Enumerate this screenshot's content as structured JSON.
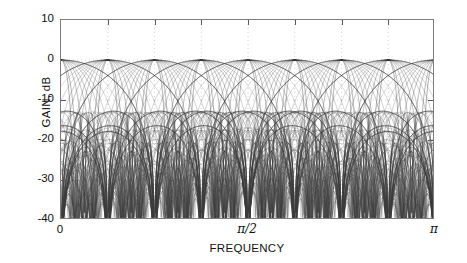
{
  "figure": {
    "kind": "magnitude-response-plot",
    "background_color": "#ffffff",
    "axis_color": "#7d7d7d",
    "curve_color": "#3c3c3c",
    "grid_color": "#c9c9c9"
  },
  "chart_data": {
    "type": "line",
    "title": "",
    "subtitle": "",
    "xlabel": "FREQUENCY",
    "ylabel": "GAIN, dB",
    "xlim": [
      0,
      3.141592653589793
    ],
    "ylim": [
      -40,
      10
    ],
    "grid": true,
    "grid_style": "dotted",
    "legend": null,
    "legend_position": "none",
    "x_tick_labels": [
      "0",
      "π/2",
      "π"
    ],
    "x_tick_values": [
      0,
      1.5707963267948966,
      3.141592653589793
    ],
    "x_minor_tick_values": [
      0.39269908169872414,
      0.7853981633974483,
      1.1780972450961724,
      1.9634954084936207,
      2.356194490192345,
      2.748893571891069
    ],
    "y_tick_labels": [
      "10",
      "0",
      "-10",
      "-20",
      "-30",
      "-40"
    ],
    "y_tick_values": [
      10,
      0,
      -10,
      -20,
      -30,
      -40
    ],
    "num_channels": 8,
    "filter_length": 8,
    "channel_center_frequencies": [
      0,
      0.39269908169872414,
      0.7853981633974483,
      1.1780972450961724,
      1.5707963267948966,
      1.9634954084936207,
      2.356194490192345,
      2.748893571891069,
      3.141592653589793
    ],
    "crossover_gain_db": -3.9,
    "peak_gain_db": 0,
    "first_sidelobe_db": -13.2,
    "floor_db": -40,
    "series_description": "Uniform 8-band DFT filter bank; each band is a Dirichlet kernel |sin(8(w-wk)/2)/(8 sin((w-wk)/2))| in dB, plus nested lower-order sinc sidelobe families.",
    "series": [
      {
        "name": "band 0",
        "center": 0
      },
      {
        "name": "band 1",
        "center": 0.39269908169872414
      },
      {
        "name": "band 2",
        "center": 0.7853981633974483
      },
      {
        "name": "band 3",
        "center": 1.1780972450961724
      },
      {
        "name": "band 4",
        "center": 1.5707963267948966
      },
      {
        "name": "band 5",
        "center": 1.9634954084936207
      },
      {
        "name": "band 6",
        "center": 2.356194490192345
      },
      {
        "name": "band 7",
        "center": 2.748893571891069
      },
      {
        "name": "band 8",
        "center": 3.141592653589793
      }
    ],
    "sidelobe_families": [
      8,
      10,
      12,
      14,
      16,
      20,
      24,
      32,
      48,
      64
    ]
  }
}
